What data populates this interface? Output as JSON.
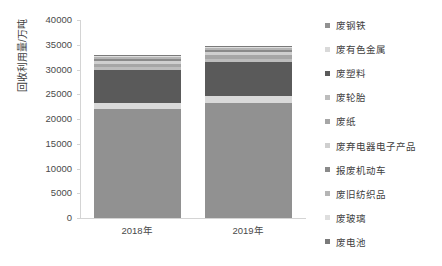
{
  "chart_data": {
    "type": "bar",
    "stacked": true,
    "title": "",
    "xlabel": "",
    "ylabel": "回收利用量/万吨",
    "ylim": [
      0,
      40000
    ],
    "ytick_step": 5000,
    "ytick_labels": [
      "40000",
      "35000",
      "30000",
      "25000",
      "20000",
      "15000",
      "10000",
      "5000",
      "0"
    ],
    "ytick_values": [
      40000,
      35000,
      30000,
      25000,
      20000,
      15000,
      10000,
      5000,
      0
    ],
    "categories": [
      "2018年",
      "2019年"
    ],
    "grid": false,
    "legend_position": "right",
    "series": [
      {
        "name": "废钢铁",
        "color": "#919191",
        "values": [
          22100,
          23300
        ]
      },
      {
        "name": "废有色金属",
        "color": "#d9d9d9",
        "values": [
          1200,
          1300
        ]
      },
      {
        "name": "废塑料",
        "color": "#5a5a5a",
        "values": [
          6700,
          7000
        ]
      },
      {
        "name": "废轮胎",
        "color": "#bdbdbd",
        "values": [
          500,
          520
        ]
      },
      {
        "name": "废纸",
        "color": "#a6a6a6",
        "values": [
          700,
          750
        ]
      },
      {
        "name": "废弃电器电子产品",
        "color": "#cfcfcf",
        "values": [
          600,
          700
        ]
      },
      {
        "name": "报废机动车",
        "color": "#8a8a8a",
        "values": [
          400,
          450
        ]
      },
      {
        "name": "废旧纺织品",
        "color": "#b5b5b5",
        "values": [
          300,
          320
        ]
      },
      {
        "name": "废玻璃",
        "color": "#dedede",
        "values": [
          250,
          280
        ]
      },
      {
        "name": "废电池",
        "color": "#7a7a7a",
        "values": [
          150,
          180
        ]
      }
    ],
    "totals": [
      32900,
      34800
    ],
    "annotations": []
  },
  "caption": {
    "text": ""
  }
}
